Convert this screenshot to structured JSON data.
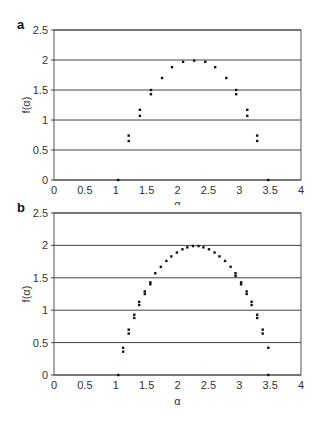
{
  "chart_data": [
    {
      "panel": "a",
      "type": "scatter",
      "title": "",
      "xlabel": "α",
      "ylabel": "f(α)",
      "xlim": [
        0,
        4
      ],
      "ylim": [
        0,
        2.5
      ],
      "xticks": [
        "0",
        "0.5",
        "1",
        "1.5",
        "2",
        "2.5",
        "3",
        "3.5",
        "4"
      ],
      "yticks": [
        "0",
        "0.5",
        "1",
        "1.5",
        "2",
        "2.5"
      ],
      "grid": "horizontal",
      "legend": null,
      "series": [
        {
          "name": "upper",
          "x": [
            1.04,
            1.21,
            1.39,
            1.57,
            1.75,
            1.91,
            2.09,
            2.27,
            2.45,
            2.61,
            2.79,
            2.95,
            3.13,
            3.29,
            3.47
          ],
          "y": [
            0.0,
            0.74,
            1.17,
            1.5,
            1.7,
            1.88,
            1.97,
            1.99,
            1.97,
            1.88,
            1.7,
            1.5,
            1.17,
            0.74,
            0.0
          ]
        },
        {
          "name": "lower",
          "x": [
            1.21,
            1.39,
            1.57,
            2.95,
            3.13,
            3.29
          ],
          "y": [
            0.65,
            1.07,
            1.43,
            1.43,
            1.07,
            0.65
          ]
        }
      ]
    },
    {
      "panel": "b",
      "type": "scatter",
      "title": "",
      "xlabel": "α",
      "ylabel": "f(α)",
      "xlim": [
        0,
        4
      ],
      "ylim": [
        0,
        2.5
      ],
      "xticks": [
        "0",
        "0.5",
        "1",
        "1.5",
        "2",
        "2.5",
        "3",
        "3.5",
        "4"
      ],
      "yticks": [
        "0",
        "0.5",
        "1",
        "1.5",
        "2",
        "2.5"
      ],
      "grid": "horizontal",
      "legend": null,
      "series": [
        {
          "name": "upper",
          "x": [
            1.04,
            1.12,
            1.21,
            1.3,
            1.38,
            1.47,
            1.56,
            1.64,
            1.73,
            1.82,
            1.9,
            1.99,
            2.08,
            2.16,
            2.25,
            2.34,
            2.42,
            2.51,
            2.6,
            2.68,
            2.77,
            2.86,
            2.94,
            3.03,
            3.12,
            3.2,
            3.29,
            3.38,
            3.47
          ],
          "y": [
            0.0,
            0.42,
            0.7,
            0.93,
            1.13,
            1.29,
            1.43,
            1.57,
            1.67,
            1.76,
            1.83,
            1.89,
            1.94,
            1.97,
            1.99,
            1.99,
            1.97,
            1.94,
            1.89,
            1.83,
            1.76,
            1.67,
            1.57,
            1.43,
            1.29,
            1.13,
            0.93,
            0.7,
            0.42
          ]
        },
        {
          "name": "lower",
          "x": [
            1.12,
            1.21,
            1.3,
            1.38,
            1.47,
            1.56,
            2.94,
            3.03,
            3.12,
            3.2,
            3.29,
            3.38,
            3.47
          ],
          "y": [
            0.36,
            0.64,
            0.88,
            1.08,
            1.25,
            1.4,
            1.53,
            1.4,
            1.25,
            1.08,
            0.88,
            0.64,
            0.0
          ]
        }
      ]
    }
  ],
  "panels": [
    {
      "label": "a",
      "xlabel": "α",
      "ylabel": "f(α)"
    },
    {
      "label": "b",
      "xlabel": "α",
      "ylabel": "f(α)"
    }
  ]
}
